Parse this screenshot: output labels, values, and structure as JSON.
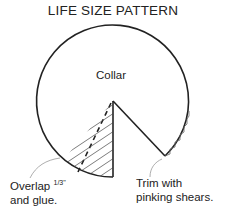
{
  "title": "LIFE SIZE PATTERN",
  "labels": {
    "collar": "Collar",
    "overlap_line1": "Overlap",
    "overlap_fraction": "1/3\"",
    "overlap_line2": "and glue.",
    "trim_line1": "Trim with",
    "trim_line2": "pinking shears."
  },
  "colors": {
    "line": "#222222",
    "leader": "#999999",
    "background": "#ffffff"
  }
}
